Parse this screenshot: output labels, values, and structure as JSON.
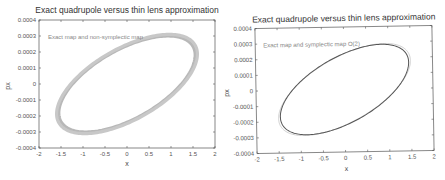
{
  "chart_data": [
    {
      "type": "line",
      "title": "Exact quadrupole versus thin lens approximation",
      "xlabel": "x",
      "ylabel": "px",
      "xlim": [
        -2,
        2
      ],
      "ylim": [
        -0.0004,
        0.0004
      ],
      "xticks": [
        "-2",
        "-1.5",
        "-1",
        "-0.5",
        "0",
        "0.5",
        "1",
        "1.5",
        "2"
      ],
      "xtick_values": [
        -2,
        -1.5,
        -1,
        -0.5,
        0,
        0.5,
        1,
        1.5,
        2
      ],
      "yticks": [
        "0.0004",
        "0.0003",
        "0.0002",
        "0.0001",
        "0",
        "-0.0001",
        "-0.0002",
        "-0.0003",
        "-0.0004"
      ],
      "ytick_values": [
        0.0004,
        0.0003,
        0.0002,
        0.0001,
        0,
        -0.0001,
        -0.0002,
        -0.0003,
        -0.0004
      ],
      "annotation": "Exact map and non-symplectic map",
      "grid": false,
      "series": [
        {
          "name": "Exact map",
          "shape": "ellipse",
          "x_amplitude": 1.55,
          "px_amplitude": 0.0003,
          "phase_deg": 53,
          "color": "#b8b8b8",
          "band": true
        },
        {
          "name": "Non-symplectic map",
          "shape": "ellipse",
          "x_amplitude": 1.6,
          "px_amplitude": 0.00031,
          "phase_deg": 53,
          "color": "#c8c8c8",
          "band": true
        }
      ]
    },
    {
      "type": "line",
      "title": "Exact quadrupole versus thin lens approximation",
      "xlabel": "x",
      "ylabel": "px",
      "xlim": [
        -2,
        2
      ],
      "ylim": [
        -0.0004,
        0.0004
      ],
      "xticks": [
        "-2",
        "-1.5",
        "-1",
        "-0.5",
        "0",
        "0.5",
        "1",
        "1.5",
        "2"
      ],
      "xtick_values": [
        -2,
        -1.5,
        -1,
        -0.5,
        0,
        0.5,
        1,
        1.5,
        2
      ],
      "yticks": [
        "0.0004",
        "0.0003",
        "0.0002",
        "0.0001",
        "0",
        "-0.0001",
        "-0.0002",
        "-0.0003",
        "-0.0004"
      ],
      "ytick_values": [
        0.0004,
        0.0003,
        0.0002,
        0.0001,
        0,
        -0.0001,
        -0.0002,
        -0.0003,
        -0.0004
      ],
      "annotation": "Exact map and symplectic map O(2)",
      "grid": false,
      "series": [
        {
          "name": "Exact map",
          "shape": "ellipse",
          "x_amplitude": 1.5,
          "px_amplitude": 0.00029,
          "phase_deg": 52,
          "color": "#c4c4c4",
          "band": false
        },
        {
          "name": "Symplectic map O(2)",
          "shape": "ellipse",
          "x_amplitude": 1.46,
          "px_amplitude": 0.000285,
          "phase_deg": 54,
          "color": "#555555",
          "band": false
        }
      ]
    }
  ]
}
